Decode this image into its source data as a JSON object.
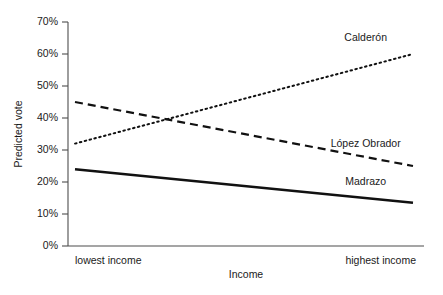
{
  "chart_data": {
    "type": "line",
    "title": "",
    "xlabel": "Income",
    "ylabel": "Predicted vote",
    "ylim": [
      0,
      70
    ],
    "xlim": [
      0,
      1
    ],
    "grid": false,
    "legend_position": "inline-right-labels",
    "ytick_labels": [
      "0%",
      "10%",
      "20%",
      "30%",
      "40%",
      "50%",
      "60%",
      "70%"
    ],
    "ytick_values": [
      0,
      10,
      20,
      30,
      40,
      50,
      60,
      70
    ],
    "xtick_labels": [
      "lowest income",
      "highest income"
    ],
    "xtick_values": [
      0,
      1
    ],
    "x": [
      0,
      1
    ],
    "series": [
      {
        "name": "Calderón",
        "values": [
          32,
          60
        ],
        "style": "dotted",
        "color": "#111111"
      },
      {
        "name": "López Obrador",
        "values": [
          45,
          25
        ],
        "style": "dashed",
        "color": "#111111"
      },
      {
        "name": "Madrazo",
        "values": [
          24,
          13.5
        ],
        "style": "solid",
        "color": "#111111"
      }
    ],
    "annotations": [
      {
        "text": "Calderón",
        "x": 0.86,
        "y": 64
      },
      {
        "text": "López Obrador",
        "x": 0.86,
        "y": 31
      },
      {
        "text": "Madrazo",
        "x": 0.86,
        "y": 19
      }
    ]
  }
}
